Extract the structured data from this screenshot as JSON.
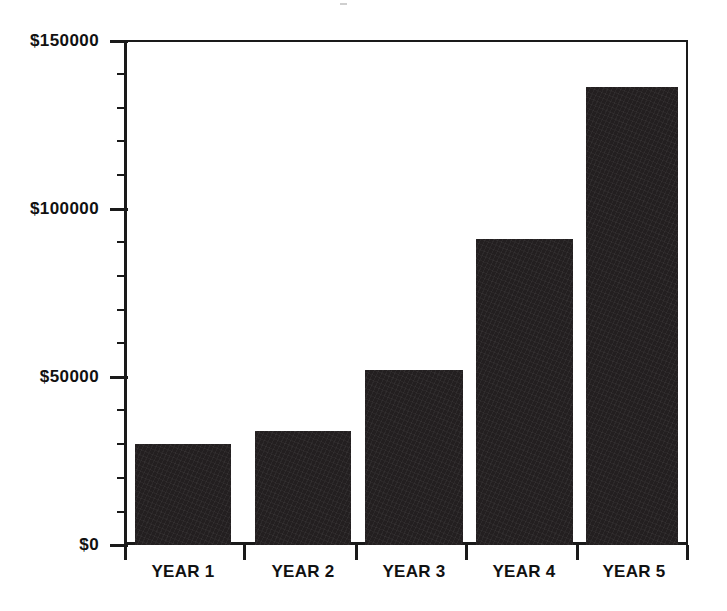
{
  "chart_data": {
    "type": "bar",
    "title": "",
    "subtitle": "",
    "xlabel": "",
    "ylabel": "",
    "categories": [
      "YEAR 1",
      "YEAR 2",
      "YEAR 3",
      "YEAR 4",
      "YEAR 5"
    ],
    "values": [
      30000,
      34000,
      52000,
      91000,
      136000
    ],
    "series": [
      {
        "name": "",
        "values": [
          30000,
          34000,
          52000,
          91000,
          136000
        ]
      }
    ],
    "ylim": [
      0,
      150000
    ],
    "ytick_labels": [
      "$0",
      "$50000",
      "$100000",
      "$150000"
    ],
    "ytick_values": [
      0,
      50000,
      100000,
      150000
    ],
    "yminor_interval": 10000,
    "grid": false,
    "legend": false,
    "legend_position": "none",
    "bar_color": "#231f20",
    "axis_color": "#1a1a1a",
    "background_color": "#ffffff",
    "annotations": []
  },
  "axes": {
    "y": {
      "ticks": [
        {
          "label": "$150000",
          "value": 150000
        },
        {
          "label": "$100000",
          "value": 100000
        },
        {
          "label": "$50000",
          "value": 50000
        },
        {
          "label": "$0",
          "value": 0
        }
      ]
    },
    "x": {
      "ticks": [
        {
          "label": "YEAR 1"
        },
        {
          "label": "YEAR 2"
        },
        {
          "label": "YEAR 3"
        },
        {
          "label": "YEAR 4"
        },
        {
          "label": "YEAR 5"
        }
      ]
    }
  }
}
